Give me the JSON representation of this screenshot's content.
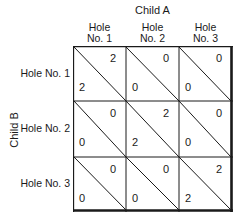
{
  "diagram": {
    "column_title": "Child A",
    "row_title": "Child B",
    "columns": [
      {
        "line1": "Hole",
        "line2": "No. 1"
      },
      {
        "line1": "Hole",
        "line2": "No. 2"
      },
      {
        "line1": "Hole",
        "line2": "No. 3"
      }
    ],
    "rows": [
      {
        "label": "Hole No. 1"
      },
      {
        "label": "Hole No. 2"
      },
      {
        "label": "Hole No. 3"
      }
    ],
    "cells": [
      [
        {
          "a": "2",
          "b": "2"
        },
        {
          "a": "0",
          "b": "0"
        },
        {
          "a": "0",
          "b": "0"
        }
      ],
      [
        {
          "a": "0",
          "b": "0"
        },
        {
          "a": "2",
          "b": "2"
        },
        {
          "a": "0",
          "b": "0"
        }
      ],
      [
        {
          "a": "0",
          "b": "0"
        },
        {
          "a": "0",
          "b": "0"
        },
        {
          "a": "2",
          "b": "2"
        }
      ]
    ],
    "cell_legend": "upper-right value = Child A payoff, lower-left value = Child B payoff",
    "line_color": "#1a1a1a"
  }
}
